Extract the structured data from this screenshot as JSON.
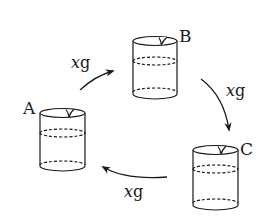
{
  "diagram": {
    "type": "cycle",
    "colors": {
      "stroke": "#1a1a1a",
      "background": "#ffffff"
    },
    "beakers": [
      {
        "id": "A",
        "label": "A"
      },
      {
        "id": "B",
        "label": "B"
      },
      {
        "id": "C",
        "label": "C"
      }
    ],
    "transfers": [
      {
        "from": "A",
        "to": "B",
        "var": "x",
        "unit": "g"
      },
      {
        "from": "B",
        "to": "C",
        "var": "x",
        "unit": "g"
      },
      {
        "from": "C",
        "to": "A",
        "var": "x",
        "unit": "g"
      }
    ]
  }
}
